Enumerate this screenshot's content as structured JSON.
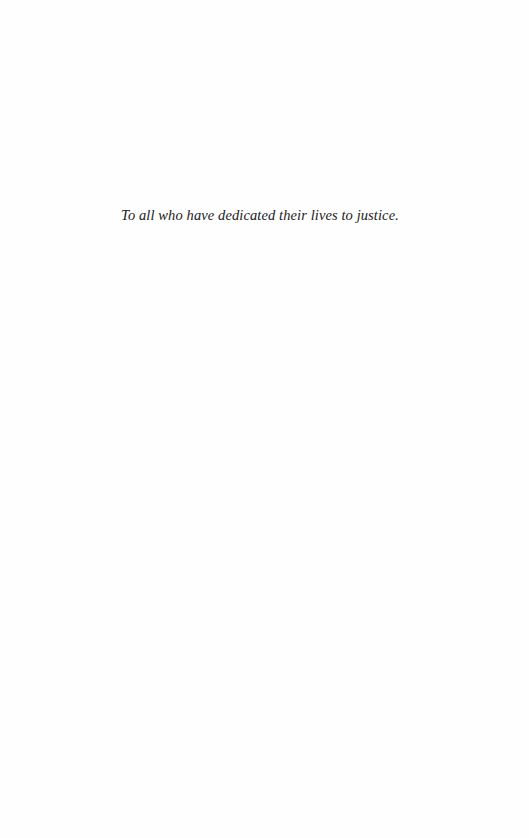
{
  "page": {
    "background_color": "#fefefe",
    "text_color": "#1a1a1a"
  },
  "dedication": {
    "text": "To all who have dedicated their lives to justice."
  }
}
